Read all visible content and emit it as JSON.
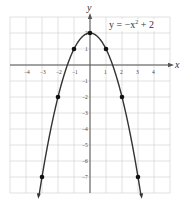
{
  "chart_data": {
    "type": "line",
    "title": "",
    "equation_label": "y = −x² + 2",
    "equation_parts": {
      "lhs": "y = −x",
      "exp": "2",
      "rhs": " + 2"
    },
    "xlabel": "x",
    "ylabel": "y",
    "xlim": [
      -5,
      5
    ],
    "ylim": [
      -8,
      3
    ],
    "grid": true,
    "x_ticks": [
      "-4",
      "-3",
      "-2",
      "-1",
      "1",
      "2",
      "3",
      "4"
    ],
    "y_ticks": [
      "2",
      "1",
      "-1",
      "-2",
      "-3",
      "-4",
      "-5",
      "-6",
      "-7"
    ],
    "series": [
      {
        "name": "y = -x^2 + 2",
        "function": "-x^2 + 2",
        "points": [
          {
            "x": -3,
            "y": -7
          },
          {
            "x": -2,
            "y": -2
          },
          {
            "x": -1,
            "y": 1
          },
          {
            "x": 0,
            "y": 2
          },
          {
            "x": 1,
            "y": 1
          },
          {
            "x": 2,
            "y": -2
          },
          {
            "x": 3,
            "y": -7
          }
        ]
      }
    ]
  },
  "colors": {
    "grid": "#cfcfcf",
    "axis": "#555555",
    "curve": "#333333",
    "point": "#111111"
  }
}
